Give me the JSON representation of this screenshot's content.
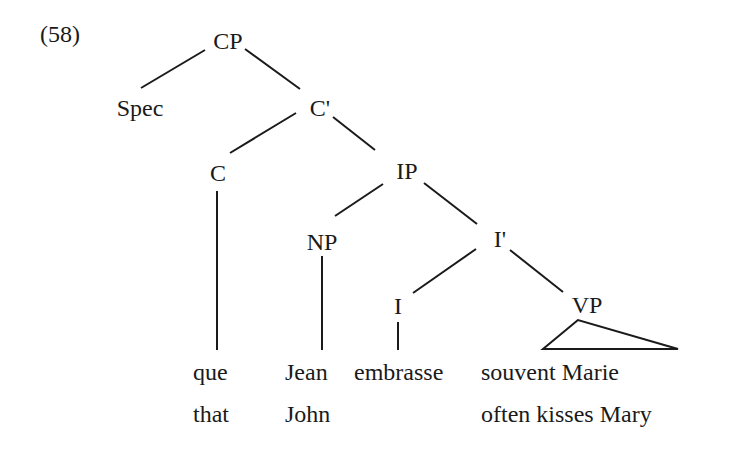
{
  "example_number": "(58)",
  "tree": {
    "nodes": {
      "cp": "CP",
      "spec": "Spec",
      "c_bar": "C'",
      "c": "C",
      "ip": "IP",
      "np": "NP",
      "i_bar": "I'",
      "i": "I",
      "vp": "VP"
    },
    "edges": [
      [
        "CP",
        "Spec"
      ],
      [
        "CP",
        "C'"
      ],
      [
        "C'",
        "C"
      ],
      [
        "C'",
        "IP"
      ],
      [
        "IP",
        "NP"
      ],
      [
        "IP",
        "I'"
      ],
      [
        "I'",
        "I"
      ],
      [
        "I'",
        "VP"
      ],
      [
        "C",
        "que"
      ],
      [
        "NP",
        "Jean"
      ],
      [
        "I",
        "embrasse"
      ],
      [
        "VP",
        "souvent Marie (triangle)"
      ]
    ]
  },
  "words": {
    "que": "que",
    "jean": "Jean",
    "embrasse": "embrasse",
    "souvent_marie": "souvent Marie"
  },
  "gloss": {
    "that": "that",
    "john": "John",
    "often_kisses_mary": "often kisses Mary"
  }
}
